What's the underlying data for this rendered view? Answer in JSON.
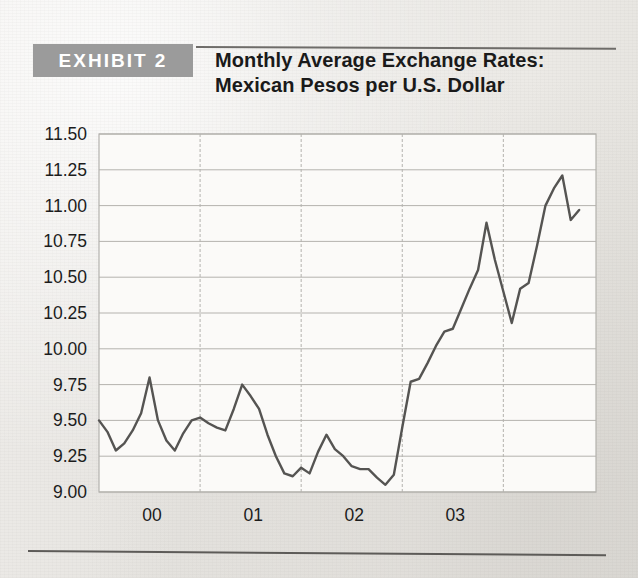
{
  "header": {
    "badge_label": "EXHIBIT 2",
    "title_line1": "Monthly Average Exchange Rates:",
    "title_line2": "Mexican Pesos per U.S. Dollar"
  },
  "colors": {
    "badge_bg": "#9b9b9b",
    "badge_text": "#ffffff",
    "title_text": "#1a1a1a",
    "line": "#555452",
    "gridline": "#b4b2ae",
    "axis_text": "#1c1c1c",
    "plot_bg": "#fbfaf8",
    "page_bg": "#e9e7e3",
    "rule": "#5d5b58"
  },
  "chart_data": {
    "type": "line",
    "title": "Monthly Average Exchange Rates: Mexican Pesos per U.S. Dollar",
    "xlabel": "",
    "ylabel": "",
    "ylim": [
      9.0,
      11.5
    ],
    "ytick_step": 0.25,
    "ytick_labels": [
      "11.50",
      "11.25",
      "11.00",
      "10.75",
      "10.50",
      "10.25",
      "10.00",
      "9.75",
      "9.50",
      "9.25",
      "9.00"
    ],
    "ytick_values": [
      11.5,
      11.25,
      11.0,
      10.75,
      10.5,
      10.25,
      10.0,
      9.75,
      9.5,
      9.25,
      9.0
    ],
    "xtick_labels": [
      "00",
      "01",
      "02",
      "03"
    ],
    "xtick_positions": [
      12,
      24,
      36,
      48
    ],
    "grid": true,
    "grid_horizontal_style": "solid",
    "grid_vertical_style": "dashed",
    "legend": null,
    "series": [
      {
        "name": "Mexican Pesos per U.S. Dollar",
        "x": [
          0,
          1,
          2,
          3,
          4,
          5,
          6,
          7,
          8,
          9,
          10,
          11,
          12,
          13,
          14,
          15,
          16,
          17,
          18,
          19,
          20,
          21,
          22,
          23,
          24,
          25,
          26,
          27,
          28,
          29,
          30,
          31,
          32,
          33,
          34,
          35,
          36,
          37,
          38,
          39,
          40,
          41,
          42,
          43,
          44,
          45,
          46,
          47,
          48,
          49,
          50,
          51,
          52,
          53,
          54,
          55,
          56,
          57
        ],
        "values": [
          9.5,
          9.42,
          9.29,
          9.34,
          9.43,
          9.55,
          9.8,
          9.5,
          9.36,
          9.29,
          9.41,
          9.5,
          9.52,
          9.48,
          9.45,
          9.43,
          9.58,
          9.75,
          9.67,
          9.58,
          9.4,
          9.25,
          9.13,
          9.11,
          9.17,
          9.13,
          9.28,
          9.4,
          9.3,
          9.25,
          9.18,
          9.16,
          9.16,
          9.1,
          9.05,
          9.12,
          9.45,
          9.77,
          9.79,
          9.9,
          10.02,
          10.12,
          10.14,
          10.28,
          10.42,
          10.55,
          10.88,
          10.62,
          10.4,
          10.18,
          10.42,
          10.46,
          10.72,
          11.0,
          11.12,
          11.21,
          10.9,
          10.97
        ]
      }
    ]
  }
}
